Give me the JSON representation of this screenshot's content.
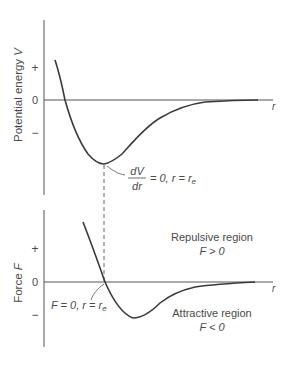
{
  "top_panel": {
    "y_label_text": "Potential energy",
    "y_label_var": "V",
    "ticks": {
      "plus": "+",
      "zero": "0",
      "minus": "−"
    },
    "x_label": "r",
    "annotation": {
      "numerator": "dV",
      "denominator": "dr",
      "rest": "= 0, r = r",
      "subscript": "e"
    }
  },
  "bottom_panel": {
    "y_label_text": "Force",
    "y_label_var": "F",
    "ticks": {
      "plus": "+",
      "zero": "0",
      "minus": "−"
    },
    "x_label": "r",
    "annotation": {
      "text": "F = 0, r = r",
      "subscript": "e"
    },
    "repulsive": {
      "title": "Repulsive region",
      "condition": "F > 0"
    },
    "attractive": {
      "title": "Attractive region",
      "condition": "F < 0"
    }
  },
  "colors": {
    "curve": "#3a3a3a",
    "axis": "#555555",
    "text": "#4a4a4a"
  }
}
